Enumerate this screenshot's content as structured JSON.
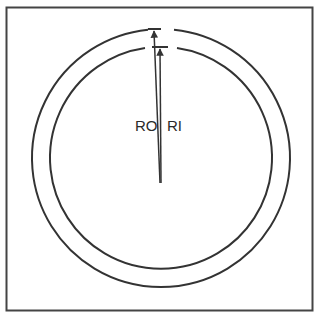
{
  "diagram": {
    "title": "",
    "labels": {
      "outer_radius": "RO",
      "inner_radius": "RI"
    },
    "colors": {
      "stroke": "#333333",
      "frame": "#444444",
      "background": "#ffffff"
    },
    "geometry": {
      "center": [
        161,
        158
      ],
      "outer_radius_px": 129,
      "inner_radius_px": 111
    }
  }
}
